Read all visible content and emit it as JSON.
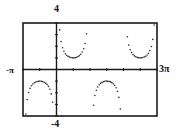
{
  "chart_data": {
    "type": "scatter",
    "title": "",
    "function": "y = csc(x)",
    "plot_mode": "dot",
    "xlabel": "",
    "ylabel": "",
    "xlim": [
      -3.14159,
      9.42478
    ],
    "ylim": [
      -4,
      4
    ],
    "x_range_labels": {
      "min": "-π",
      "max": "3π"
    },
    "y_range_labels": {
      "max": "4",
      "min": "-4"
    },
    "x_tick_step": "π/2",
    "y_tick_step": 1,
    "grid": false,
    "legend": null,
    "series": [
      {
        "name": "csc(x)",
        "color": "#222222",
        "branches": [
          {
            "x_interval": [
              "-π",
              "0"
            ],
            "extremum": {
              "x": "-π/2",
              "y": -1
            },
            "direction": "down"
          },
          {
            "x_interval": [
              "0",
              "π"
            ],
            "extremum": {
              "x": "π/2",
              "y": 1
            },
            "direction": "up"
          },
          {
            "x_interval": [
              "π",
              "2π"
            ],
            "extremum": {
              "x": "3π/2",
              "y": -1
            },
            "direction": "down"
          },
          {
            "x_interval": [
              "2π",
              "3π"
            ],
            "extremum": {
              "x": "5π/2",
              "y": 1
            },
            "direction": "up"
          }
        ]
      }
    ]
  },
  "labels": {
    "ymax": "4",
    "ymin": "-4",
    "xmin": "-π",
    "xmax": "3π"
  },
  "colors": {
    "frame": "#1a1a1a",
    "dots": "#2a2a2a"
  }
}
